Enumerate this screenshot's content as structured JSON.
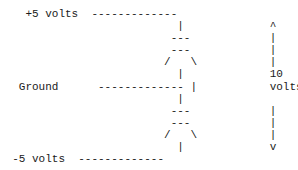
{
  "diagram": {
    "type": "ascii-voltage-divider",
    "labels": {
      "top_rail": "+5 volts",
      "middle_rail": "Ground",
      "bottom_rail": "-5 volts",
      "span_value": "10",
      "span_unit": "volts"
    },
    "rows": [
      "    +5 volts  -------------",
      "                           |             ^",
      "                          ---            |",
      "                          ---            |",
      "                         /   \\           |",
      "                           |             10",
      "   Ground      ------------- |           volts",
      "                           |",
      "                          ---            |",
      "                          ---            |",
      "                         /   \\           |",
      "                           |             v",
      "  -5 volts  -------------"
    ]
  }
}
